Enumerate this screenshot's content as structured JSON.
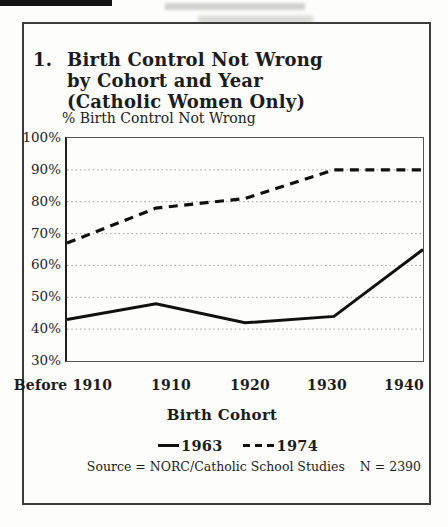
{
  "colors": {
    "ink": "#1c1c1c",
    "line": "#101010",
    "grid": "#a0a09c",
    "frame": "#3b3b39",
    "background": "#fdfdfb"
  },
  "figure": {
    "number": "1.",
    "title_lines": [
      "Birth Control Not Wrong",
      "by Cohort and Year",
      "(Catholic Women Only)"
    ],
    "y_axis_title": "% Birth Control Not Wrong",
    "x_axis_title": "Birth Cohort",
    "source_text": "Source = NORC/Catholic School Studies",
    "sample_size": "N = 2390"
  },
  "chart_data": {
    "type": "line",
    "title": "Birth Control Not Wrong by Cohort and Year (Catholic Women Only)",
    "categories": [
      "Before 1910",
      "1910",
      "1920",
      "1930",
      "1940"
    ],
    "series": [
      {
        "name": "1963",
        "line_style": "solid",
        "values": [
          43,
          48,
          42,
          44,
          65
        ]
      },
      {
        "name": "1974",
        "line_style": "dashed",
        "values": [
          67,
          78,
          81,
          90,
          90
        ]
      }
    ],
    "xlabel": "Birth Cohort",
    "ylabel": "% Birth Control Not Wrong",
    "ylim": [
      30,
      100
    ],
    "ytick_step": 10,
    "ytick_labels": [
      "100%",
      "90%",
      "80%",
      "70%",
      "60%",
      "50%",
      "40%",
      "30%"
    ],
    "grid": "horizontal-dotted",
    "legend_position": "bottom",
    "legend": [
      {
        "label": "1963",
        "style": "solid"
      },
      {
        "label": "1974",
        "style": "dashed"
      }
    ]
  }
}
